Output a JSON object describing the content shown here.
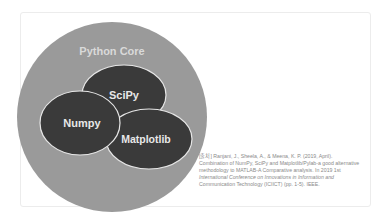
{
  "diagram": {
    "outer": {
      "label": "Python Core",
      "fill": "#9a9a9a",
      "text_color": "#d9d9d9"
    },
    "nodes": [
      {
        "id": "scipy",
        "label": "SciPy",
        "fill": "#3a3a3a"
      },
      {
        "id": "numpy",
        "label": "Numpy",
        "fill": "#3a3a3a"
      },
      {
        "id": "matplotlib",
        "label": "Matplotlib",
        "fill": "#3a3a3a"
      }
    ],
    "stroke": "#e6e6e6",
    "node_text_color": "#e8e8e8"
  },
  "caption": {
    "line1": "[출처] Ranjani, J., Sheela, A., & Meena, K. P. (2019, April).",
    "line2": "Combination of NumPy, SciPy and Matplotlib/Pylab-a good alternative",
    "line3": "methodology to MATLAB-A Comparative analysis. In 2019 1st",
    "line4": "International Conference on Innovations in Information and",
    "line5": "Communication Technology (ICIICT) (pp. 1-5). IEEE."
  }
}
